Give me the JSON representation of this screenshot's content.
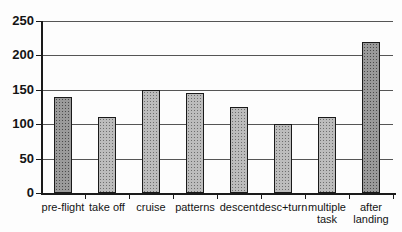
{
  "chart_data": {
    "type": "bar",
    "title": "",
    "xlabel": "",
    "ylabel": "",
    "categories": [
      "pre-flight",
      "take off",
      "cruise",
      "patterns",
      "descent",
      "desc+turn",
      "multiple task",
      "after landing"
    ],
    "values": [
      140,
      110,
      150,
      145,
      125,
      100,
      110,
      220
    ],
    "ylim": [
      0,
      250
    ],
    "yticks": [
      0,
      50,
      100,
      150,
      200,
      250
    ],
    "grid": true,
    "legend": false,
    "bar_styles": [
      "dark",
      "light",
      "light",
      "light",
      "light",
      "light",
      "light",
      "dark"
    ]
  },
  "colors": {
    "background": "#fdfdfd",
    "axis": "#1a1a1a",
    "gridline": "#555555",
    "text": "#141414",
    "bar_light": "#bcbcbc",
    "bar_dark": "#9a9a9a",
    "bar_dot_light": "#6e6e6e",
    "bar_dot_dark": "#4a4a4a",
    "bar_border": "#1a1a1a"
  }
}
